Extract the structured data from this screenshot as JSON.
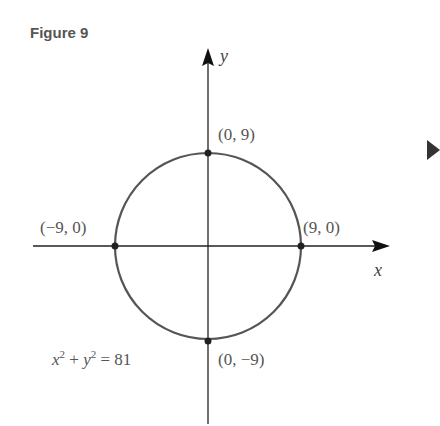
{
  "figure": {
    "title": "Figure 9",
    "equation": "x² + y² = 81",
    "axes": {
      "x_label": "x",
      "y_label": "y"
    },
    "points": [
      {
        "label": "(0, 9)",
        "x": 0,
        "y": 9
      },
      {
        "label": "(−9, 0)",
        "x": -9,
        "y": 0
      },
      {
        "label": "(9, 0)",
        "x": 9,
        "y": 0
      },
      {
        "label": "(0, −9)",
        "x": 0,
        "y": -9
      }
    ],
    "circle": {
      "center": [
        0,
        0
      ],
      "radius": 9
    },
    "colors": {
      "curve": "#555555",
      "axis": "#222222",
      "text": "#555555",
      "nav_arrow": "#333333"
    }
  },
  "nav": {
    "next_icon": "triangle-right-icon"
  }
}
